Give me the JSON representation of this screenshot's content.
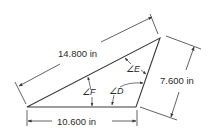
{
  "diagram": {
    "type": "triangle-dimension-figure",
    "colors": {
      "line": "#3a3a3a",
      "text": "#2a2a2a",
      "background": "#ffffff"
    },
    "vertices": {
      "bottom_left": [
        27,
        107
      ],
      "bottom_right": [
        136,
        107
      ],
      "top_right": [
        160,
        38
      ]
    },
    "dimensions": {
      "hypotenuse": {
        "label": "14.800 in"
      },
      "right_side": {
        "label": "7.600 in"
      },
      "base": {
        "label": "10.600 in"
      }
    },
    "angles": [
      {
        "id": "D",
        "label": "∠D"
      },
      {
        "id": "E",
        "label": "∠E"
      },
      {
        "id": "F",
        "label": "∠F"
      }
    ]
  }
}
